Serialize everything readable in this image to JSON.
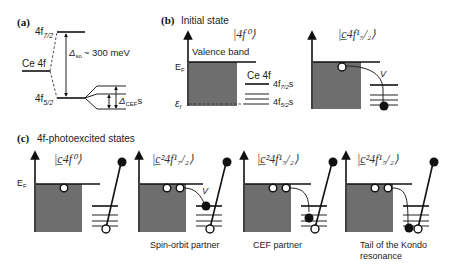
{
  "panels": {
    "a": {
      "label": "(a)",
      "ce4f": "Ce 4f",
      "j72": "4f",
      "j72_sub": "7/2",
      "j52": "4f",
      "j52_sub": "5/2",
      "delta_so": "Δ",
      "delta_so_sub": "so",
      "delta_so_val": "~ 300 meV",
      "delta_cef": "Δ",
      "delta_cef_sub": "CEF",
      "delta_cef_suffix": "s"
    },
    "b": {
      "label": "(b)",
      "title": "Initial state",
      "ket1": "|4f⁰⟩",
      "ket2": "|c̲4f¹₅/₂⟩",
      "valence_band": "Valence band",
      "ef": "E",
      "ef_sub": "F",
      "epsf": "ε",
      "epsf_sub": "f",
      "ce4f": "Ce 4f",
      "j72s": "4f",
      "j72s_sub": "7/2",
      "j72s_suffix": "s",
      "j52s": "4f",
      "j52s_sub": "5/2",
      "j52s_suffix": "s",
      "hyb": "V"
    },
    "c": {
      "label": "(c)",
      "title": "4f-photoexcited states",
      "ef": "E",
      "ef_sub": "F",
      "states": [
        {
          "ket": "|c̲4f⁰⟩",
          "caption": ""
        },
        {
          "ket": "|c̲²4f¹₇/₂⟩",
          "caption": "Spin-orbit partner",
          "hyb": "V"
        },
        {
          "ket": "|c̲²4f¹₅/₂⟩",
          "caption": "CEF partner"
        },
        {
          "ket": "|c̲²4f¹₅/₂⟩",
          "caption": "Tail of the Kondo",
          "caption2": "resonance"
        }
      ]
    }
  }
}
